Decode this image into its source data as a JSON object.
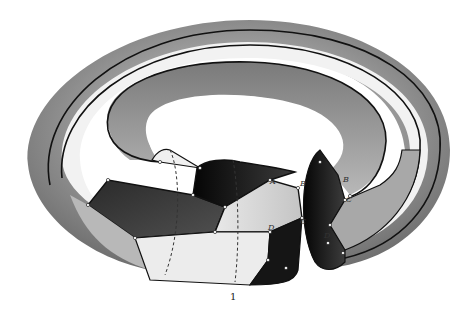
{
  "figure": {
    "cut_label": "1",
    "vertex_labels_left": [
      "A",
      "B",
      "C",
      "D"
    ],
    "vertex_labels_right": [
      "B",
      "C",
      "D"
    ],
    "colors": {
      "background": "#ffffff",
      "torus_mid_gray": "#8a8a8a",
      "torus_light_gray": "#c8c8c8",
      "region_dark": "#3a3a3a",
      "region_black": "#141414",
      "region_light": "#dcdcdc",
      "region_white": "#f4f4f4",
      "edge": "#111111"
    }
  }
}
